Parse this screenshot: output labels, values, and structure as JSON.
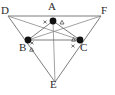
{
  "figure": {
    "type": "geometry-diagram",
    "width": 115,
    "height": 95,
    "background_color": "#ffffff",
    "line_color": "#6e6e6e",
    "point_color": "#111111",
    "text_color": "#2b2b2b",
    "tick_color": "#3a3a3a"
  },
  "labels": {
    "A": "A",
    "B": "B",
    "C": "C",
    "D": "D",
    "E": "E",
    "F": "F"
  },
  "points": [
    {
      "id": "A",
      "label": "A",
      "x": 53,
      "y": 21,
      "filled": true,
      "label_x": 48,
      "label_y": 3
    },
    {
      "id": "B",
      "label": "B",
      "x": 28,
      "y": 40,
      "filled": true,
      "label_x": 20,
      "label_y": 44
    },
    {
      "id": "C",
      "label": "C",
      "x": 80,
      "y": 40,
      "filled": true,
      "label_x": 81,
      "label_y": 44
    },
    {
      "id": "D",
      "label": "D",
      "x": 8,
      "y": 16,
      "filled": false,
      "label_x": 1,
      "label_y": 7
    },
    {
      "id": "E",
      "label": "E",
      "x": 55,
      "y": 82,
      "filled": false,
      "label_x": 50,
      "label_y": 80
    },
    {
      "id": "F",
      "label": "F",
      "x": 101,
      "y": 16,
      "filled": false,
      "label_x": 100,
      "label_y": 7
    }
  ],
  "segments": [
    {
      "id": "DF",
      "from": "D",
      "to": "F",
      "name": "top-edge-DF"
    },
    {
      "id": "DE",
      "from": "D",
      "to": "E",
      "name": "left-edge-DE"
    },
    {
      "id": "FE",
      "from": "F",
      "to": "E",
      "name": "right-edge-FE"
    },
    {
      "id": "BC",
      "from": "B",
      "to": "C",
      "name": "midline-BC"
    },
    {
      "id": "BA",
      "from": "B",
      "to": "A",
      "name": "midline-BA"
    },
    {
      "id": "AC",
      "from": "A",
      "to": "C",
      "name": "midline-AC"
    },
    {
      "id": "AE",
      "from": "A",
      "to": "E",
      "name": "cevian-AE"
    },
    {
      "id": "BF",
      "from": "B",
      "to": "F",
      "name": "cevian-BF"
    },
    {
      "id": "CD",
      "from": "C",
      "to": "D",
      "name": "cevian-CD"
    }
  ],
  "angle_marks": [
    {
      "id": "A-cross",
      "symbol": "x",
      "x": 45,
      "y": 22,
      "name": "angle-mark-cross-at-A"
    },
    {
      "id": "A-triangle",
      "symbol": "triangle",
      "x": 62,
      "y": 23,
      "name": "angle-mark-triangle-at-A"
    },
    {
      "id": "B-cross",
      "symbol": "x",
      "x": 32,
      "y": 43,
      "name": "angle-mark-cross-at-B"
    },
    {
      "id": "B-triangle",
      "symbol": "triangle",
      "x": 31,
      "y": 51,
      "name": "angle-mark-triangle-at-B"
    },
    {
      "id": "C-triangle",
      "symbol": "triangle",
      "x": 73,
      "y": 41,
      "name": "angle-mark-triangle-at-C"
    },
    {
      "id": "C-cross",
      "symbol": "x",
      "x": 73,
      "y": 48,
      "name": "angle-mark-cross-at-C"
    }
  ]
}
